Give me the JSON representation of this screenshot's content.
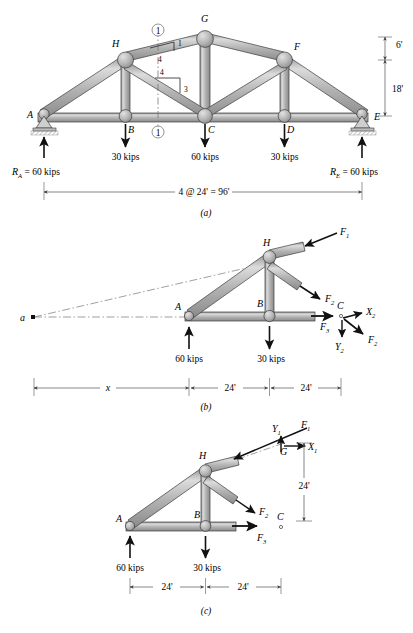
{
  "figure": {
    "panels": [
      {
        "id": "a",
        "caption": "(a)"
      },
      {
        "id": "b",
        "caption": "(b)"
      },
      {
        "id": "c",
        "caption": "(c)"
      }
    ]
  },
  "panel_a": {
    "joints": [
      "A",
      "B",
      "C",
      "D",
      "E",
      "F",
      "G",
      "H"
    ],
    "joint_labels": {
      "A": "A",
      "B": "B",
      "C": "C",
      "D": "D",
      "E": "E",
      "F": "F",
      "G": "G",
      "H": "H"
    },
    "loads": [
      {
        "at": "B",
        "label": "30 kips"
      },
      {
        "at": "C",
        "label": "60 kips"
      },
      {
        "at": "D",
        "label": "30 kips"
      }
    ],
    "reactions": [
      {
        "at": "A",
        "label": "R",
        "sub": "A",
        "value": "= 60 kips"
      },
      {
        "at": "E",
        "label": "R",
        "sub": "E",
        "value": "= 60 kips"
      }
    ],
    "section_marks": [
      {
        "label": "1",
        "position": "top"
      },
      {
        "label": "1",
        "position": "bottom"
      }
    ],
    "slopes": [
      {
        "rise": "1",
        "run": "4",
        "member": "top-chord-H-G"
      },
      {
        "rise": "4",
        "run": "3",
        "member": "diagonal-H-C"
      }
    ],
    "vertical_dimensions": [
      {
        "label": "6'",
        "span": "G-to-F-level"
      },
      {
        "label": "18'",
        "span": "F-level-to-E"
      }
    ],
    "span_dimension": "4 @ 24' = 96'",
    "caption": "(a)"
  },
  "panel_b": {
    "joint_labels": {
      "A": "A",
      "B": "B",
      "C": "C",
      "H": "H",
      "a": "a"
    },
    "forces": [
      {
        "label": "F",
        "sub": "1",
        "at": "H",
        "direction": "down-left"
      },
      {
        "label": "F",
        "sub": "2",
        "at": "H",
        "direction": "down-right"
      },
      {
        "label": "F",
        "sub": "3",
        "at": "B",
        "direction": "right"
      }
    ],
    "components_at_c": [
      {
        "label": "X",
        "sub": "2",
        "direction": "right"
      },
      {
        "label": "Y",
        "sub": "2",
        "direction": "down"
      },
      {
        "label": "F",
        "sub": "2",
        "direction": "down-right"
      }
    ],
    "loads": [
      {
        "at": "A",
        "label": "60 kips",
        "direction": "up"
      },
      {
        "at": "B",
        "label": "30 kips",
        "direction": "down"
      }
    ],
    "dimensions": [
      "x",
      "24'",
      "24'"
    ],
    "caption": "(b)"
  },
  "panel_c": {
    "joint_labels": {
      "A": "A",
      "B": "B",
      "C": "C",
      "G": "G",
      "H": "H"
    },
    "forces": [
      {
        "label": "F",
        "sub": "1",
        "at": "G",
        "direction": "down-left"
      },
      {
        "label": "F",
        "sub": "2",
        "at": "H",
        "direction": "down-right"
      },
      {
        "label": "F",
        "sub": "3",
        "at": "B",
        "direction": "right"
      }
    ],
    "components_at_g": [
      {
        "label": "Y",
        "sub": "1",
        "direction": "up"
      },
      {
        "label": "X",
        "sub": "1",
        "direction": "right"
      }
    ],
    "loads": [
      {
        "at": "A",
        "label": "60 kips",
        "direction": "up"
      },
      {
        "at": "B",
        "label": "30 kips",
        "direction": "down"
      }
    ],
    "vertical_dimension": "24'",
    "dimensions": [
      "24'",
      "24'"
    ],
    "caption": "(c)"
  },
  "colors": {
    "member_fill": "#b4b4b4",
    "member_light": "#d8d8d8",
    "member_dark": "#8a8a8a",
    "outline": "#3c3c3c",
    "background": "#ffffff",
    "dimension": "#555555"
  }
}
